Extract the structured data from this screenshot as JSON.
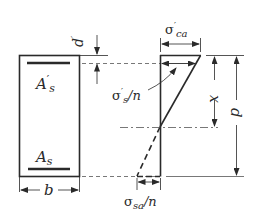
{
  "diagram": {
    "labels": {
      "compression_steel": "A",
      "compression_steel_prime": "′",
      "compression_steel_sub": "s",
      "tension_steel": "A",
      "tension_steel_sub": "s",
      "width": "b",
      "cover_depth": "d",
      "cover_depth_prime": "′",
      "concrete_stress": "σ",
      "concrete_stress_prime": "′",
      "concrete_stress_sub": "ca",
      "compression_steel_stress": "σ",
      "compression_steel_stress_prime": "′",
      "compression_steel_stress_sub": "s",
      "compression_steel_stress_div": "/n",
      "tension_steel_stress": "σ",
      "tension_steel_stress_sub": "sa",
      "tension_steel_stress_div": "/n",
      "neutral_axis_depth": "x",
      "effective_depth": "d"
    },
    "colors": {
      "stroke": "#2a2a2a",
      "background": "#ffffff"
    }
  }
}
